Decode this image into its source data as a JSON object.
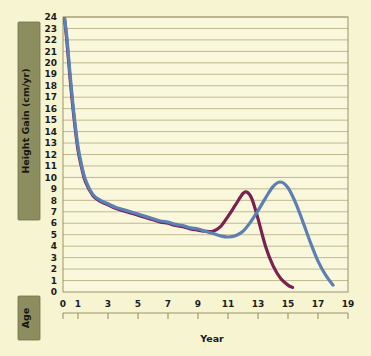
{
  "figure": {
    "background_color": "#F7F4D2",
    "plot_background_color": "#FAF8DC",
    "gridline_color": "#B9B184",
    "axis_color": "#9A9468",
    "band_color": "#8C8E60",
    "band_border_color": "#6E7049"
  },
  "labels": {
    "y_axis_band": "Height Gain (cm/yr)",
    "x_axis_band": "Age",
    "x_axis_title": "Year"
  },
  "chart_data": {
    "type": "line",
    "title": "",
    "subtitle": "",
    "xlabel": "Year",
    "ylabel": "Height Gain (cm/yr)",
    "xlim": [
      0,
      19
    ],
    "ylim": [
      0,
      24
    ],
    "grid": true,
    "grid_axis": "y",
    "legend_position": "none",
    "x_ticks": [
      0,
      1,
      3,
      5,
      7,
      9,
      11,
      13,
      15,
      17,
      19
    ],
    "x_tick_labels": [
      "0",
      "1",
      "3",
      "5",
      "7",
      "9",
      "11",
      "13",
      "15",
      "17",
      "19"
    ],
    "y_ticks": [
      0,
      1,
      2,
      3,
      4,
      5,
      6,
      7,
      8,
      9,
      10,
      11,
      12,
      13,
      14,
      15,
      16,
      17,
      18,
      19,
      20,
      21,
      22,
      23,
      24
    ],
    "y_tick_labels": [
      "0",
      "1",
      "2",
      "3",
      "4",
      "5",
      "6",
      "7",
      "8",
      "9",
      "10",
      "11",
      "12",
      "13",
      "14",
      "15",
      "16",
      "17",
      "18",
      "19",
      "20",
      "21",
      "22",
      "23",
      "24"
    ],
    "annotations": [],
    "series": [
      {
        "name": "girls-growth-velocity",
        "color": "#7A2150",
        "line_width": 3.2,
        "x": [
          0.0,
          0.25,
          0.5,
          0.75,
          1.0,
          1.25,
          1.5,
          2.0,
          2.5,
          3.0,
          3.5,
          4.0,
          4.5,
          5.0,
          5.5,
          6.0,
          6.5,
          7.0,
          7.5,
          8.0,
          8.5,
          9.0,
          9.5,
          10.0,
          10.5,
          11.0,
          11.5,
          12.0,
          12.3,
          12.6,
          13.0,
          13.5,
          14.0,
          14.5,
          15.0,
          15.3
        ],
        "y": [
          25.0,
          22.0,
          18.2,
          15.0,
          12.4,
          10.8,
          9.6,
          8.4,
          7.9,
          7.6,
          7.3,
          7.1,
          6.9,
          6.7,
          6.5,
          6.3,
          6.1,
          6.0,
          5.8,
          5.7,
          5.5,
          5.4,
          5.3,
          5.3,
          5.7,
          6.6,
          7.6,
          8.6,
          8.7,
          8.1,
          6.4,
          4.0,
          2.3,
          1.2,
          0.6,
          0.4
        ]
      },
      {
        "name": "boys-growth-velocity",
        "color": "#5C7FB4",
        "line_width": 3.2,
        "x": [
          0.0,
          0.25,
          0.5,
          0.75,
          1.0,
          1.25,
          1.5,
          2.0,
          2.5,
          3.0,
          3.5,
          4.0,
          4.5,
          5.0,
          5.5,
          6.0,
          6.5,
          7.0,
          7.5,
          8.0,
          8.5,
          9.0,
          9.5,
          10.0,
          10.5,
          11.0,
          11.5,
          12.0,
          12.5,
          13.0,
          13.5,
          14.0,
          14.5,
          15.0,
          15.5,
          16.0,
          16.5,
          17.0,
          17.5,
          18.0
        ],
        "y": [
          25.0,
          22.3,
          18.6,
          15.3,
          12.7,
          11.0,
          9.8,
          8.5,
          8.0,
          7.7,
          7.4,
          7.2,
          7.0,
          6.8,
          6.6,
          6.4,
          6.2,
          6.1,
          5.9,
          5.8,
          5.6,
          5.5,
          5.3,
          5.1,
          4.9,
          4.8,
          4.9,
          5.3,
          6.1,
          7.1,
          8.2,
          9.2,
          9.6,
          9.1,
          7.8,
          6.1,
          4.3,
          2.7,
          1.5,
          0.6
        ]
      }
    ]
  }
}
